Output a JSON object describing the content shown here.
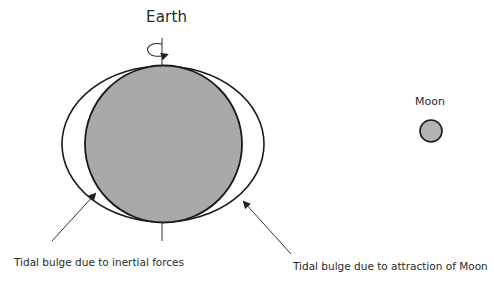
{
  "diagram": {
    "title": "Earth",
    "moon_label": "Moon",
    "annotations": [
      {
        "text": "Tidal bulge due to inertial forces",
        "points_to": "left-bulge"
      },
      {
        "text": "Tidal bulge due to attraction of Moon",
        "points_to": "right-bulge"
      }
    ],
    "colors": {
      "earth_fill": "#a9a9a9",
      "moon_fill": "#b3b3b3",
      "outline": "#1a1a1a",
      "arrow": "#333333",
      "background": "#ffffff"
    }
  }
}
